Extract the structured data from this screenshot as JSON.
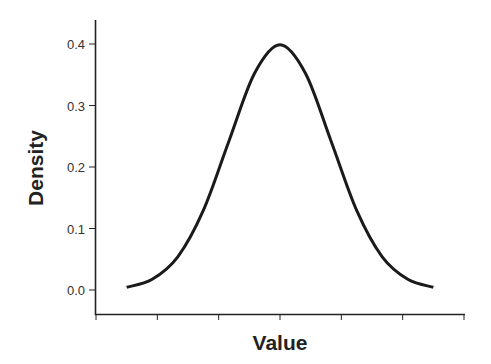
{
  "chart_data": {
    "type": "line",
    "title": "",
    "xlabel": "Value",
    "ylabel": "Density",
    "ylim": [
      -0.04,
      0.44
    ],
    "xlim": [
      -3.6,
      3.6
    ],
    "grid": false,
    "legend": null,
    "y_ticks": [
      0.0,
      0.1,
      0.2,
      0.3,
      0.4
    ],
    "y_tick_labels": [
      "0.0",
      "0.1",
      "0.2",
      "0.3",
      "0.4"
    ],
    "x_ticks_count": 7,
    "x_tick_labels": [],
    "series": [
      {
        "name": "Normal density",
        "color": "#1a1a1a",
        "x": [
          -3.0,
          -2.5,
          -2.0,
          -1.5,
          -1.0,
          -0.5,
          0.0,
          0.5,
          1.0,
          1.5,
          2.0,
          2.5,
          3.0
        ],
        "values": [
          0.0044,
          0.0175,
          0.054,
          0.1295,
          0.242,
          0.3521,
          0.3989,
          0.3521,
          0.242,
          0.1295,
          0.054,
          0.0175,
          0.0044
        ]
      }
    ]
  },
  "axes": {
    "x_title": "Value",
    "y_title": "Density"
  }
}
